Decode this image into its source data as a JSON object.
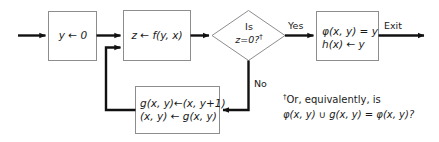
{
  "diagram": {
    "type": "flowchart",
    "background_color": "#ffffff",
    "line_color": "#111111",
    "box_stroke_color": "#8d8d8d",
    "text_color": "#1a1a1a"
  },
  "nodes": {
    "init": {
      "shape": "rectangle",
      "text": "y ← 0"
    },
    "compute": {
      "shape": "rectangle",
      "text": "z ← f(y, x)"
    },
    "decision": {
      "shape": "diamond",
      "line1": "Is",
      "line2": "z=0?",
      "marker": "†"
    },
    "output": {
      "shape": "rectangle",
      "line1": "φ(x, y) = y",
      "line2": "h(x) ← y"
    },
    "increment": {
      "shape": "rectangle",
      "line1": "g(x, y)←(x, y+1)",
      "line2": "(x, y) ← g(x, y)"
    }
  },
  "edges": {
    "yes_label": "Yes",
    "no_label": "No",
    "exit_label": "Exit"
  },
  "footnote": {
    "marker": "†",
    "line1": "Or, equivalently, is",
    "line2": "φ(x, y) ∪ g(x, y) = φ(x, y)?"
  }
}
